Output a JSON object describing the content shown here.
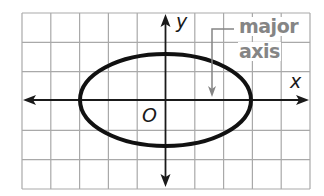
{
  "figure": {
    "type": "ellipse-on-coordinate-grid",
    "grid": {
      "x_range": [
        -5,
        5
      ],
      "y_range": [
        -3,
        3
      ],
      "cell_count_x": 10,
      "cell_count_y": 6,
      "line_color": "#a9a9a9"
    },
    "axes": {
      "x_label": "x",
      "y_label": "y",
      "origin_label": "O",
      "color": "#1a1a1a"
    },
    "ellipse": {
      "center": [
        0,
        0
      ],
      "semi_major_x": 3,
      "semi_minor_y": 1.6,
      "stroke_color": "#111111"
    },
    "annotation": {
      "line1": "major",
      "line2": "axis",
      "color": "#858585"
    }
  }
}
